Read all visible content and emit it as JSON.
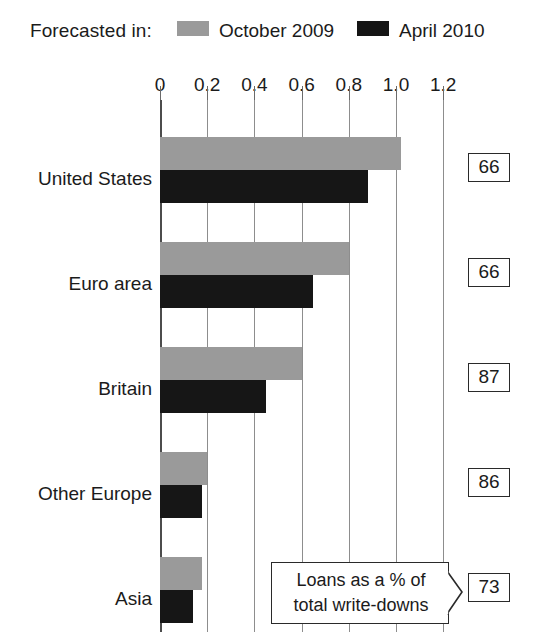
{
  "legend": {
    "title": "Forecasted in:",
    "entries": [
      {
        "label": "October 2009",
        "color": "#9a9a9a",
        "swatch_name": "legend-swatch-october-2009"
      },
      {
        "label": "April 2010",
        "color": "#161616",
        "swatch_name": "legend-swatch-april-2010"
      }
    ]
  },
  "callout": {
    "line1": "Loans as a % of",
    "line2": "total write-downs"
  },
  "chart_data": {
    "type": "bar",
    "orientation": "horizontal",
    "title": "",
    "subtitle": "",
    "xlabel": "",
    "ylabel": "",
    "xlim": [
      0,
      1.2
    ],
    "grid": true,
    "legend_position": "top",
    "tick_labels": [
      "0",
      "0.2",
      "0.4",
      "0.6",
      "0.8",
      "1.0",
      "1.2"
    ],
    "tick_values": [
      0,
      0.2,
      0.4,
      0.6,
      0.8,
      1.0,
      1.2
    ],
    "categories": [
      "United States",
      "Euro area",
      "Britain",
      "Other Europe",
      "Asia"
    ],
    "series": [
      {
        "name": "October 2009",
        "color": "#9a9a9a",
        "values": [
          1.02,
          0.8,
          0.6,
          0.2,
          0.18
        ]
      },
      {
        "name": "April 2010",
        "color": "#161616",
        "values": [
          0.88,
          0.65,
          0.45,
          0.18,
          0.14
        ]
      }
    ],
    "annotations": {
      "right_column_label": "Loans as a % of total write-downs",
      "right_column_values": [
        66,
        66,
        87,
        86,
        73
      ]
    }
  }
}
